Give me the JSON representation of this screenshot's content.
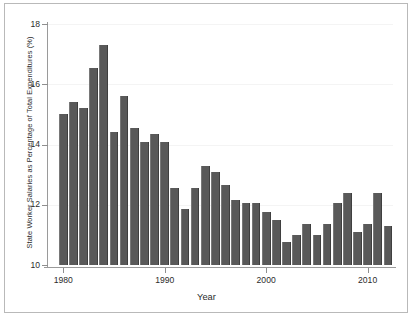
{
  "chart_data": {
    "type": "bar",
    "title": "",
    "xlabel": "Year",
    "ylabel": "State Worker Salaries as Percentage of Total Expenditures (%)",
    "ylim": [
      10,
      18
    ],
    "xlim": [
      1979,
      2013
    ],
    "grid": true,
    "legend": null,
    "ytick_labels": [
      "10",
      "12",
      "14",
      "16",
      "18"
    ],
    "ytick_values": [
      10,
      12,
      14,
      16,
      18
    ],
    "xtick_labels": [
      "1980",
      "1990",
      "2000",
      "2010"
    ],
    "xtick_values": [
      1980,
      1990,
      2000,
      2010
    ],
    "bar_color": "#595959",
    "categories": [
      "1980",
      "1981",
      "1982",
      "1983",
      "1984",
      "1985",
      "1986",
      "1987",
      "1988",
      "1989",
      "1990",
      "1991",
      "1992",
      "1993",
      "1994",
      "1995",
      "1996",
      "1997",
      "1998",
      "1999",
      "2000",
      "2001",
      "2002",
      "2003",
      "2004",
      "2005",
      "2006",
      "2007",
      "2008",
      "2009",
      "2010",
      "2011",
      "2012"
    ],
    "values": [
      15.0,
      15.4,
      15.2,
      16.55,
      17.3,
      14.4,
      15.6,
      14.55,
      14.1,
      14.35,
      14.1,
      12.55,
      11.85,
      12.55,
      13.3,
      13.1,
      12.65,
      12.15,
      12.05,
      12.05,
      11.75,
      11.5,
      10.75,
      11.0,
      11.35,
      11.0,
      11.35,
      12.05,
      12.4,
      11.1,
      11.35,
      12.4,
      11.3
    ]
  },
  "figure": {
    "border_color": "#b9b9b9",
    "background": "#ffffff"
  }
}
